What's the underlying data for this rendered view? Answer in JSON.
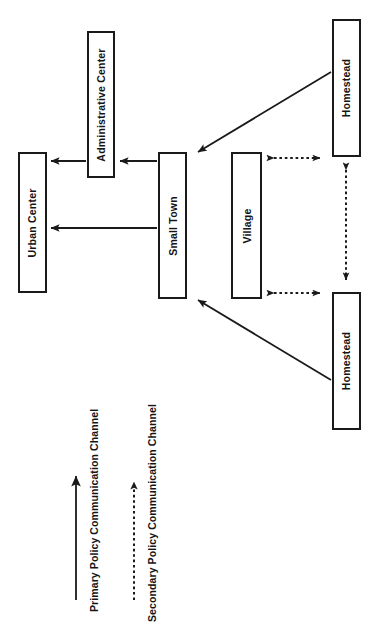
{
  "diagram": {
    "orientation": "rotated-90",
    "background_color": "#ffffff",
    "line_color": "#1a1a1a",
    "nodes": [
      {
        "id": "urban_center",
        "label": "Urban Center",
        "x": 18,
        "y": 152,
        "w": 29,
        "h": 141
      },
      {
        "id": "administrative_center",
        "label": "Administrative Center",
        "x": 87,
        "y": 31,
        "w": 28,
        "h": 147
      },
      {
        "id": "small_town",
        "label": "Small Town",
        "x": 158,
        "y": 152,
        "w": 29,
        "h": 147
      },
      {
        "id": "village",
        "label": "Village",
        "x": 231,
        "y": 152,
        "w": 31,
        "h": 147
      },
      {
        "id": "homestead_top",
        "label": "Homestead",
        "x": 332,
        "y": 19,
        "w": 29,
        "h": 138
      },
      {
        "id": "homestead_bottom",
        "label": "Homestead",
        "x": 332,
        "y": 292,
        "w": 29,
        "h": 138
      }
    ],
    "edges": [
      {
        "id": "admin-to-urban",
        "from": "administrative_center",
        "to": "urban_center",
        "style": "solid",
        "heads": 1
      },
      {
        "id": "smalltown-to-admin",
        "from": "small_town",
        "to": "administrative_center",
        "style": "solid",
        "heads": 1
      },
      {
        "id": "smalltown-to-urban",
        "from": "small_town",
        "to": "urban_center",
        "style": "solid",
        "heads": 1
      },
      {
        "id": "homesteadtop-to-smalltown",
        "from": "homestead_top",
        "to": "small_town",
        "style": "solid",
        "heads": 1
      },
      {
        "id": "homesteadbottom-to-smalltown",
        "from": "homestead_bottom",
        "to": "small_town",
        "style": "solid",
        "heads": 1
      },
      {
        "id": "village-homesteadtop",
        "from": "village",
        "to": "homestead_top",
        "style": "dotted",
        "heads": 2
      },
      {
        "id": "village-homesteadbottom",
        "from": "village",
        "to": "homestead_bottom",
        "style": "dotted",
        "heads": 2
      },
      {
        "id": "homesteadtop-homesteadbottom",
        "from": "homestead_top",
        "to": "homestead_bottom",
        "style": "dotted",
        "heads": 2
      }
    ]
  },
  "legend": {
    "items": [
      {
        "id": "primary",
        "label": "Primary Policy Communication Channel",
        "style": "solid"
      },
      {
        "id": "secondary",
        "label": "Secondary Policy Communication Channel",
        "style": "dotted"
      }
    ]
  }
}
